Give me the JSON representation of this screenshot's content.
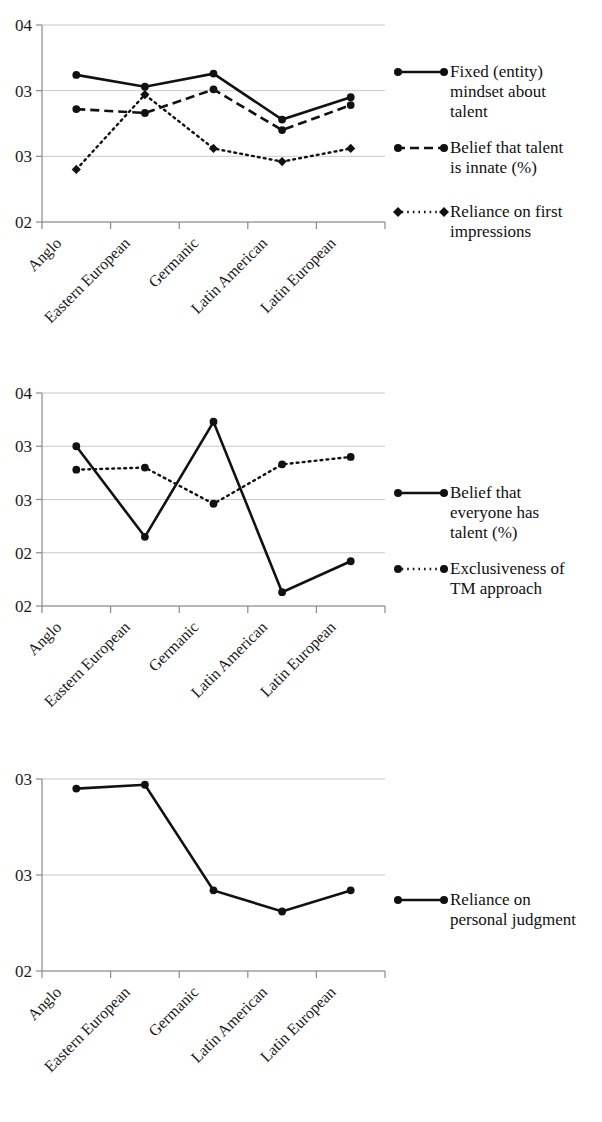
{
  "figure": {
    "background": "#ffffff",
    "line_color": "#111111",
    "grid_color": "#c9c9c9"
  },
  "categories": [
    "Anglo",
    "Eastern European",
    "Germanic",
    "Latin American",
    "Latin European"
  ],
  "chart_data": [
    {
      "type": "line",
      "title": "",
      "xlabel": "",
      "ylabel": "",
      "grid": true,
      "legend_position": "right",
      "categories": [
        "Anglo",
        "Eastern European",
        "Germanic",
        "Latin American",
        "Latin European"
      ],
      "ytick_labels": [
        "04",
        "03",
        "03",
        "02"
      ],
      "ytick_values": [
        4.0,
        3.5,
        3.0,
        2.5
      ],
      "ylim": [
        2.5,
        4.0
      ],
      "series": [
        {
          "name": "Fixed (entity) mindset about talent",
          "style": "solid",
          "marker": "circle",
          "values": [
            3.62,
            3.53,
            3.63,
            3.28,
            3.45
          ]
        },
        {
          "name": "Belief that talent is innate (%)",
          "style": "dashed",
          "marker": "circle",
          "values": [
            3.36,
            3.33,
            3.51,
            3.2,
            3.39
          ]
        },
        {
          "name": "Reliance on first impressions",
          "style": "dotted",
          "marker": "diamond",
          "values": [
            2.9,
            3.47,
            3.06,
            2.96,
            3.06
          ]
        }
      ]
    },
    {
      "type": "line",
      "title": "",
      "xlabel": "",
      "ylabel": "",
      "grid": true,
      "legend_position": "right",
      "categories": [
        "Anglo",
        "Eastern European",
        "Germanic",
        "Latin American",
        "Latin European"
      ],
      "ytick_labels": [
        "04",
        "03",
        "03",
        "02",
        "02"
      ],
      "ytick_values": [
        4.0,
        3.5,
        3.0,
        2.5,
        2.0
      ],
      "ylim": [
        2.0,
        4.0
      ],
      "series": [
        {
          "name": "Belief that everyone has talent (%)",
          "style": "solid",
          "marker": "circle",
          "values": [
            3.5,
            2.65,
            3.73,
            2.13,
            2.42
          ]
        },
        {
          "name": "Exclusiveness of TM approach",
          "style": "dotted",
          "marker": "circle",
          "values": [
            3.28,
            3.3,
            2.96,
            3.33,
            3.4
          ]
        }
      ]
    },
    {
      "type": "line",
      "title": "",
      "xlabel": "",
      "ylabel": "",
      "grid": true,
      "legend_position": "right",
      "categories": [
        "Anglo",
        "Eastern European",
        "Germanic",
        "Latin American",
        "Latin European"
      ],
      "ytick_labels": [
        "03",
        "03",
        "02"
      ],
      "ytick_values": [
        3.5,
        3.0,
        2.5
      ],
      "ylim": [
        2.5,
        3.5
      ],
      "series": [
        {
          "name": "Reliance on personal judgment",
          "style": "solid",
          "marker": "circle",
          "values": [
            3.45,
            3.47,
            2.92,
            2.81,
            2.92
          ]
        }
      ]
    }
  ],
  "legends": {
    "chart1": [
      {
        "label": "Fixed (entity)\nmindset about\ntalent",
        "style": "solid",
        "marker": "circle"
      },
      {
        "label": "Belief that talent\nis innate (%)",
        "style": "dashed",
        "marker": "circle"
      },
      {
        "label": "Reliance on first\nimpressions",
        "style": "dotted",
        "marker": "diamond"
      }
    ],
    "chart2": [
      {
        "label": "Belief that\neveryone has\ntalent (%)",
        "style": "solid",
        "marker": "circle"
      },
      {
        "label": "Exclusiveness of\nTM approach",
        "style": "dotted",
        "marker": "circle"
      }
    ],
    "chart3": [
      {
        "label": "Reliance on\npersonal judgment",
        "style": "solid",
        "marker": "circle"
      }
    ]
  }
}
